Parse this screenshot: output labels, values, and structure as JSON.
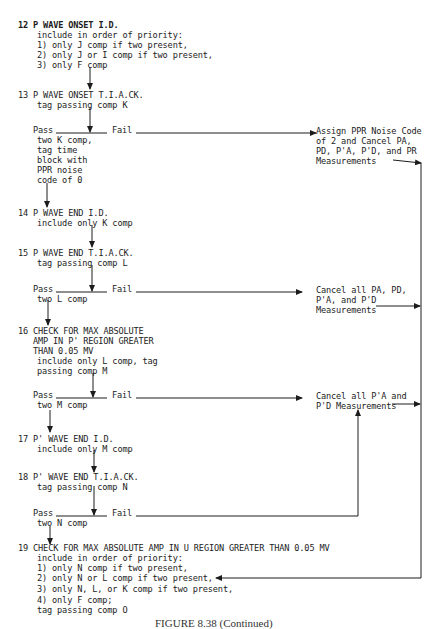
{
  "steps": {
    "s12": {
      "title": "12 P WAVE ONSET I.D.",
      "lines": [
        "include in order of priority:",
        "1) only J comp if two present,",
        "2) only J or I comp if two present,",
        "3) only F comp"
      ]
    },
    "s13": {
      "title": "13 P WAVE ONSET T.I.A.CK.",
      "lines": [
        "tag passing comp K"
      ],
      "pass_label": "Pass",
      "fail_label": "Fail",
      "pass_lines": [
        "two K comp,",
        "tag time",
        "block with",
        "PPR noise",
        "code of 0"
      ]
    },
    "s14": {
      "title": "14 P WAVE END I.D.",
      "lines": [
        "include only K comp"
      ]
    },
    "s15": {
      "title": "15 P WAVE END T.I.A.CK.",
      "lines": [
        "tag passing comp L"
      ],
      "pass_label": "Pass",
      "fail_label": "Fail",
      "pass_lines": [
        "two L comp"
      ]
    },
    "s16": {
      "title_lines": [
        "16 CHECK FOR MAX ABSOLUTE",
        "AMP IN P' REGION GREATER",
        "THAN 0.05 MV"
      ],
      "lines": [
        "include only L comp, tag",
        "passing comp M"
      ],
      "pass_label": "Pass",
      "fail_label": "Fail",
      "pass_lines": [
        "two M comp"
      ]
    },
    "s17": {
      "title": "17 P' WAVE END I.D.",
      "lines": [
        "include only M comp"
      ]
    },
    "s18": {
      "title": "18 P' WAVE END T.I.A.CK.",
      "lines": [
        "tag passing comp N"
      ],
      "pass_label": "Pass",
      "fail_label": "Fail",
      "pass_lines": [
        "two N comp"
      ]
    },
    "s19": {
      "title": "19 CHECK FOR MAX ABSOLUTE AMP IN U REGION GREATER THAN 0.05 MV",
      "lines": [
        "include in order of priority:",
        "1) only N comp if two present,",
        "2) only N or L comp if two present,",
        "3) only N, L, or K comp if two present,",
        "4) only F comp;",
        "tag passing comp O"
      ]
    }
  },
  "actions": {
    "a1": [
      "Assign PPR Noise Code",
      "of 2 and Cancel PA,",
      "PD, P'A, P'D, and PR",
      "Measurements"
    ],
    "a2": [
      "Cancel all PA, PD,",
      "P'A, and P'D",
      "Measurements"
    ],
    "a3": [
      "Cancel all P'A and",
      "P'D Measurements"
    ]
  },
  "caption": "FIGURE 8.38 (Continued)"
}
